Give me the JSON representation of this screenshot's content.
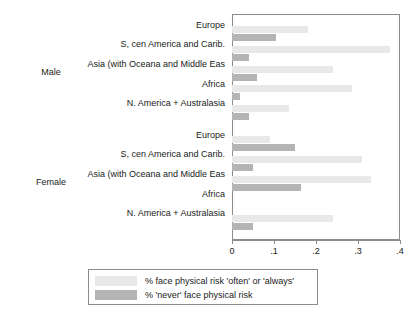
{
  "chart_data": {
    "type": "bar",
    "orientation": "horizontal",
    "title": "",
    "subtitle": "",
    "xlabel": "",
    "ylabel": "",
    "xlim": [
      0,
      0.4
    ],
    "xticks": [
      0,
      0.1,
      0.2,
      0.3,
      0.4
    ],
    "xtick_labels": [
      "0",
      ".1",
      ".2",
      ".3",
      ".4"
    ],
    "grid": false,
    "legend_position": "bottom",
    "panels": [
      {
        "label": "Male",
        "categories": [
          "Europe",
          "S, cen America and Carib.",
          "Asia (with Oceana and Middle Eas",
          "Africa",
          "N. America + Australasia"
        ],
        "series": [
          {
            "name": "% face physical risk 'often' or 'always'",
            "values": [
              0.18,
              0.375,
              0.24,
              0.285,
              0.135
            ]
          },
          {
            "name": "% 'never' face physical risk",
            "values": [
              0.105,
              0.04,
              0.06,
              0.02,
              0.04
            ]
          }
        ]
      },
      {
        "label": "Female",
        "categories": [
          "Europe",
          "S, cen America and Carib.",
          "Asia (with Oceana and Middle Eas",
          "Africa",
          "N. America + Australasia"
        ],
        "series": [
          {
            "name": "% face physical risk 'often' or 'always'",
            "values": [
              0.09,
              0.31,
              0.33,
              0.0,
              0.24
            ]
          },
          {
            "name": "% 'never' face physical risk",
            "values": [
              0.15,
              0.05,
              0.165,
              0.0,
              0.05
            ]
          }
        ]
      }
    ],
    "legend": [
      {
        "label": "% face physical risk 'often' or 'always'",
        "color": "#e8e8e8"
      },
      {
        "label": "% 'never' face physical risk",
        "color": "#b4b4b4"
      }
    ],
    "colors": {
      "series_light": "#e8e8e8",
      "series_dark": "#b4b4b4",
      "axis": "#8c8c8c",
      "text": "#1a1a1a",
      "background": "#ffffff"
    }
  }
}
